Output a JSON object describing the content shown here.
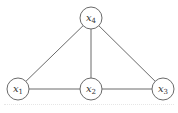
{
  "diagram": {
    "type": "undirected-graph",
    "nodes": [
      {
        "id": "x4",
        "label": "x",
        "sub": "4",
        "cx": 91,
        "cy": 18
      },
      {
        "id": "x1",
        "label": "x",
        "sub": "1",
        "cx": 18,
        "cy": 89
      },
      {
        "id": "x2",
        "label": "x",
        "sub": "2",
        "cx": 91,
        "cy": 89
      },
      {
        "id": "x3",
        "label": "x",
        "sub": "3",
        "cx": 163,
        "cy": 89
      }
    ],
    "edges": [
      {
        "from": "x4",
        "to": "x1"
      },
      {
        "from": "x4",
        "to": "x2"
      },
      {
        "from": "x4",
        "to": "x3"
      },
      {
        "from": "x1",
        "to": "x2"
      },
      {
        "from": "x2",
        "to": "x3"
      }
    ],
    "node_radius": 11,
    "colors": {
      "stroke": "#6a6a6a",
      "text": "#333333",
      "background": "#ffffff"
    }
  }
}
